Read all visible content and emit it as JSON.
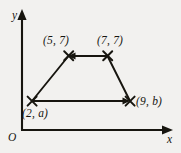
{
  "figure": {
    "type": "coordinate-geometry-diagram",
    "background_color": "#f2f1ef",
    "ink_color": "#17150f",
    "axes": {
      "x_axis_label": "x",
      "y_axis_label": "y",
      "origin_label": "O",
      "x_axis_arrow": "right",
      "y_axis_arrow": "up",
      "ticks_shown": false,
      "gridlines_shown": false
    },
    "shape": {
      "name": "trapezoid",
      "vertex_marker": "x-cross",
      "vertices": [
        {
          "id": "top-left",
          "label": "(5, 7)",
          "x_value": 5,
          "y_value": 7,
          "label_position": "above-left"
        },
        {
          "id": "top-right",
          "label": "(7, 7)",
          "x_value": 7,
          "y_value": 7,
          "label_position": "above-right"
        },
        {
          "id": "bottom-right",
          "label": "(9, b)",
          "x_value": 9,
          "y_value": "b",
          "label_position": "right"
        },
        {
          "id": "bottom-left",
          "label": "(2, a)",
          "x_value": 2,
          "y_value": "a",
          "label_position": "below-left"
        }
      ],
      "edges": [
        {
          "from": "top-right",
          "to": "top-left",
          "arrowhead": "at-end",
          "direction": "leftward"
        },
        {
          "from": "bottom-left",
          "to": "bottom-right",
          "arrowhead": "at-end",
          "direction": "rightward"
        },
        {
          "from": "bottom-left",
          "to": "top-left",
          "arrowhead": "none",
          "direction": "upward-right"
        },
        {
          "from": "top-right",
          "to": "bottom-right",
          "arrowhead": "none",
          "direction": "downward-right"
        }
      ]
    }
  }
}
